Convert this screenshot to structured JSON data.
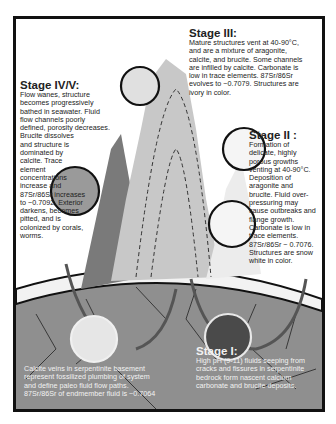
{
  "stages": {
    "stage3": {
      "title": "Stage III:",
      "lines": [
        "Mature structures vent at 40-90°C,",
        "and are a mixture of aragonite,",
        "calcite, and brucite. Some channels",
        "are infilled by calcite. Carbonate is",
        "low in trace elements. 87Sr/86Sr",
        "evolves to ~0.7079. Structures are",
        "ivory in color."
      ]
    },
    "stage45": {
      "title": "Stage IV/V:",
      "lines": [
        "Flow wanes, structure",
        "becomes progressively",
        "bathed in seawater. Fluid",
        "flow channels poorly",
        "defined, porosity decreases.",
        "Brucite dissolves",
        "and structure is",
        "dominated by",
        "calcite. Trace",
        "element",
        "concentrations",
        "increase and",
        "87Sr/86Sr increases",
        "to ~0.7092. Exterior",
        "darkens, becomes",
        "pitted, and is",
        "colonized by corals,",
        "worms."
      ]
    },
    "stage2": {
      "title": "Stage II :",
      "lines": [
        "Formation of",
        "delicate, highly",
        "porous growths",
        "venting at 40-90°C.",
        "Deposition of",
        "aragonite and",
        "brucite. Fluid over-",
        "pressuring may",
        "cause outbreaks and",
        "flange growth.",
        "Carbonate is low in",
        "trace elements.",
        "87Sr/86Sr ~ 0.7076.",
        "Structures are snow",
        "white in color."
      ]
    },
    "stage1": {
      "title": "Stage I:",
      "lines": [
        "High pH (9-11) fluids seeping from",
        "cracks and fissures in serpentinite",
        "bedrock form nascent calcium",
        "carbonate and brucite deposits."
      ]
    },
    "basement": {
      "lines": [
        "Calcite veins in serpentinite basement",
        "represent fossilized plumbing of system",
        "and define paleo  fluid flow paths.",
        "87Sr/86Sr of endmember  fluid is ~0.7064"
      ]
    }
  },
  "colors": {
    "frame": "#111111",
    "bedrock": "#8f8f8f",
    "sediment_band": "#f2f2f2",
    "old_chimney": "#7a7a7a",
    "mature_chimney": "#c8c8c8",
    "young_chimney": "#ececec",
    "arrow": "#555555"
  }
}
